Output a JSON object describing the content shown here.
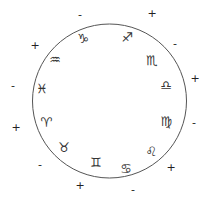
{
  "diagram": {
    "circle": {
      "cx": 109.5,
      "cy": 101,
      "r": 77,
      "stroke": "#555555"
    },
    "signs": [
      {
        "name": "capricorn",
        "glyph": "♑",
        "x": 83,
        "y": 38
      },
      {
        "name": "sagittarius",
        "glyph": "♐",
        "x": 127,
        "y": 37
      },
      {
        "name": "scorpio",
        "glyph": "♏",
        "x": 152,
        "y": 60
      },
      {
        "name": "libra",
        "glyph": "♎",
        "x": 166,
        "y": 85
      },
      {
        "name": "virgo",
        "glyph": "♍",
        "x": 166,
        "y": 121
      },
      {
        "name": "leo",
        "glyph": "♌",
        "x": 151,
        "y": 151
      },
      {
        "name": "cancer",
        "glyph": "♋",
        "x": 126,
        "y": 168
      },
      {
        "name": "gemini",
        "glyph": "♊",
        "x": 96,
        "y": 162
      },
      {
        "name": "taurus",
        "glyph": "♉",
        "x": 64,
        "y": 147
      },
      {
        "name": "aries",
        "glyph": "♈",
        "x": 46,
        "y": 122
      },
      {
        "name": "pisces",
        "glyph": "♓",
        "x": 42,
        "y": 88
      },
      {
        "name": "aquarius",
        "glyph": "♒",
        "x": 55,
        "y": 59
      }
    ],
    "polarities": [
      {
        "symbol": "-",
        "x": 80,
        "y": 14
      },
      {
        "symbol": "+",
        "x": 152,
        "y": 13
      },
      {
        "symbol": "-",
        "x": 175,
        "y": 43
      },
      {
        "symbol": "+",
        "x": 195,
        "y": 78
      },
      {
        "symbol": "-",
        "x": 194,
        "y": 122
      },
      {
        "symbol": "+",
        "x": 171,
        "y": 167
      },
      {
        "symbol": "-",
        "x": 133,
        "y": 189
      },
      {
        "symbol": "+",
        "x": 80,
        "y": 185
      },
      {
        "symbol": "-",
        "x": 40,
        "y": 164
      },
      {
        "symbol": "+",
        "x": 16,
        "y": 127
      },
      {
        "symbol": "-",
        "x": 13,
        "y": 85
      },
      {
        "symbol": "+",
        "x": 35,
        "y": 45
      }
    ]
  }
}
